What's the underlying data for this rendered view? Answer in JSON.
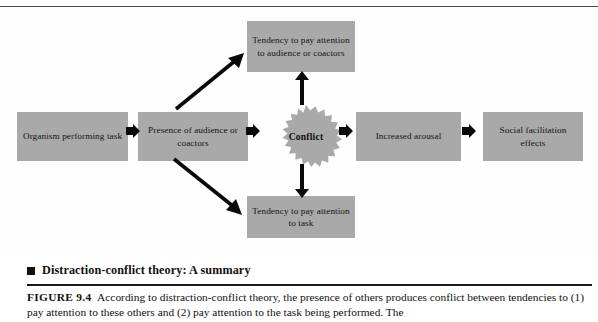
{
  "figure": {
    "diagram_type": "flowchart",
    "boxes": [
      {
        "id": "organism",
        "label": "Organism performing task"
      },
      {
        "id": "presence",
        "label": "Presence of audience or coactors"
      },
      {
        "id": "tendency_aud",
        "label": "Tendency to pay attention to audience or coactors"
      },
      {
        "id": "tendency_task",
        "label": "Tendency to pay attention to task"
      },
      {
        "id": "arousal",
        "label": "Increased arousal"
      },
      {
        "id": "social",
        "label": "Social facilitation effects"
      }
    ],
    "burst": {
      "label": "Conflict"
    },
    "colors": {
      "box_fill": "#a9a9a9",
      "box_text": "#121212",
      "arrow": "#0a0a0a",
      "page_background": "#fdfdfc",
      "rule": "#1c1c1c"
    }
  },
  "caption": {
    "bullet_icon": "filled-square-icon",
    "title": "Distraction-conflict theory: A summary",
    "figure_label": "FIGURE 9.4",
    "body_line1": "According to distraction-conflict theory, the presence of others produces conflict between",
    "body_line2": "tendencies to (1) pay attention to these others and (2) pay attention to the task being performed. The"
  }
}
